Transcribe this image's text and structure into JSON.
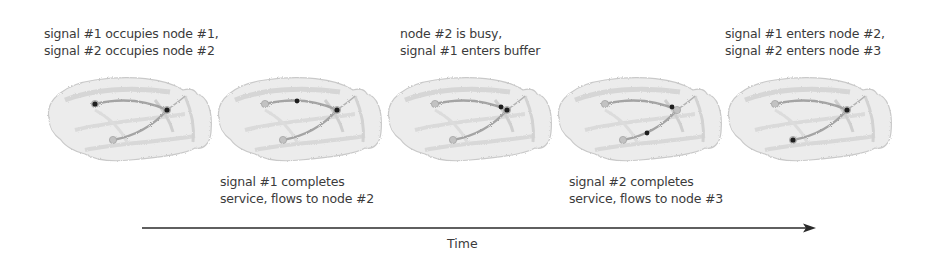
{
  "captions_top": [
    {
      "lines": [
        "signal #1 occupies node #1,",
        "signal #2 occupies node #2"
      ]
    },
    {
      "lines": [
        "node #2 is busy,",
        "signal #1 enters buffer"
      ]
    },
    {
      "lines": [
        "signal #1 enters node #2,",
        "signal #2 enters node #3"
      ]
    }
  ],
  "captions_bottom": [
    {
      "lines": [
        "signal #1 completes",
        "service, flows to node #2"
      ]
    },
    {
      "lines": [
        "signal #2 completes",
        "service, flows to node #3"
      ]
    }
  ],
  "axis": {
    "label": "Time"
  },
  "brains": [
    {
      "step": 1,
      "signals": [
        "node-1",
        "node-2"
      ]
    },
    {
      "step": 2,
      "signals": [
        "path-1-2",
        "node-2"
      ]
    },
    {
      "step": 3,
      "signals": [
        "buffer",
        "node-2"
      ]
    },
    {
      "step": 4,
      "signals": [
        "node-2",
        "path-2-3"
      ]
    },
    {
      "step": 5,
      "signals": [
        "node-2",
        "node-3"
      ]
    }
  ],
  "colors": {
    "text": "#3b3b3b",
    "brain_fill": "#e9e9e9",
    "pathway": "#9a9a9a",
    "signal": "#1e1e1e"
  }
}
